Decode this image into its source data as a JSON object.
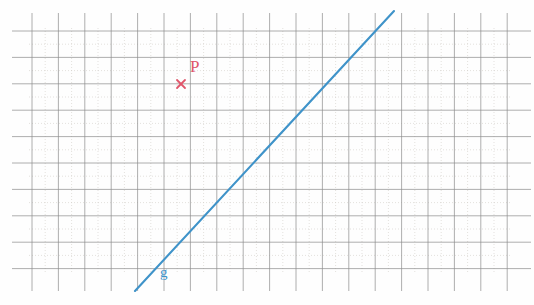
{
  "figure": {
    "kind": "geometry-grid-diagram",
    "background_color": "#fefefe"
  },
  "grid": {
    "major_line_color": "#8d8d8d",
    "minor_line_color": "#cfcac4",
    "major_spacing_px": 26.4,
    "minor_spacing_px": 13.2,
    "origin_x": 32,
    "origin_y": 31,
    "columns": 18,
    "rows": 9,
    "right_edge": 507,
    "bottom_edge": 269
  },
  "line": {
    "name": "g",
    "label": "g",
    "label_color": "#3f93c9",
    "stroke_color": "#3f93c9",
    "stroke_width": 2.1,
    "x1": 135,
    "y1": 291,
    "x2": 394,
    "y2": 11,
    "label_x": 160,
    "label_y": 265
  },
  "point": {
    "name": "P",
    "label": "P",
    "color": "#e0556a",
    "marker": "x-cross",
    "marker_x": 181,
    "marker_y": 84,
    "marker_size": 8,
    "label_x": 190,
    "label_y": 58
  },
  "labels": {
    "point_label": "P",
    "line_label": "g"
  }
}
